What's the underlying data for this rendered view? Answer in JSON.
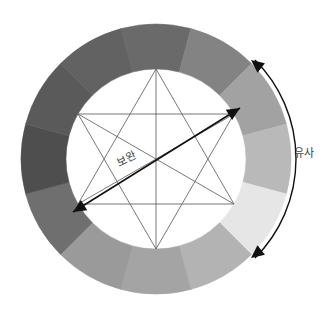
{
  "diagram": {
    "center": [
      156,
      159
    ],
    "outer_radius": 135,
    "inner_radius": 90,
    "segment_start_angle_deg": -105,
    "segments": [
      {
        "name": "top",
        "color": "#6a6a6a"
      },
      {
        "name": "top-right-1",
        "color": "#838383"
      },
      {
        "name": "top-right-2",
        "color": "#a2a2a2"
      },
      {
        "name": "right",
        "color": "#b9b9b9"
      },
      {
        "name": "bottom-right-1",
        "color": "#e6e6e6"
      },
      {
        "name": "bottom-right-2",
        "color": "#b3b3b3"
      },
      {
        "name": "bottom",
        "color": "#a4a4a4"
      },
      {
        "name": "bottom-left-1",
        "color": "#9a9a9a"
      },
      {
        "name": "bottom-left-2",
        "color": "#6f6f6f"
      },
      {
        "name": "left",
        "color": "#4e4e4e"
      },
      {
        "name": "top-left-2",
        "color": "#5a5a5a"
      },
      {
        "name": "top-left-1",
        "color": "#626262"
      }
    ],
    "star": {
      "radius": 90,
      "stroke": "#555555",
      "stroke_width": 0.8
    },
    "complement_arrow": {
      "from": [
        240,
        108
      ],
      "to": [
        73,
        212
      ],
      "color": "#111111",
      "label": "보완"
    },
    "analogous_arc": {
      "radius": 140,
      "start_angle_deg": -45,
      "end_angle_deg": 45,
      "color": "#111111",
      "label": "유사"
    }
  }
}
